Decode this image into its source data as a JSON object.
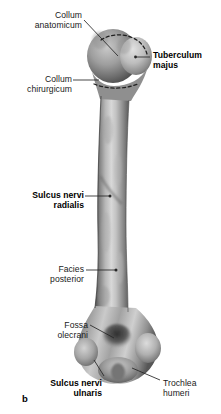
{
  "figure": {
    "letter": "b",
    "background_color": "#ffffff",
    "text_color": "#1a1a1a",
    "leader_line_color": "#262626"
  },
  "labels": [
    {
      "id": "collum-anatomicum",
      "line1": "Collum",
      "line2": "anatomicum",
      "bold": false,
      "align": "right",
      "x": 22,
      "y": 10
    },
    {
      "id": "tuberculum-majus",
      "line1": "Tuberculum",
      "line2": "majus",
      "bold": true,
      "align": "left",
      "x": 152,
      "y": 50
    },
    {
      "id": "collum-chirurgicum",
      "line1": "Collum",
      "line2": "chirurgicum",
      "bold": false,
      "align": "right",
      "x": 17,
      "y": 74
    },
    {
      "id": "sulcus-nervi-radialis",
      "line1": "Sulcus nervi",
      "line2": "radialis",
      "bold": true,
      "align": "right",
      "x": 16,
      "y": 190
    },
    {
      "id": "facies-posterior",
      "line1": "Facies",
      "line2": "posterior",
      "bold": false,
      "align": "right",
      "x": 36,
      "y": 264
    },
    {
      "id": "fossa-olecrani",
      "line1": "Fossa",
      "line2": "olecrani",
      "bold": false,
      "align": "right",
      "x": 44,
      "y": 320
    },
    {
      "id": "sulcus-nervi-ulnaris",
      "line1": "Sulcus nervi",
      "line2": "ulnaris",
      "bold": true,
      "align": "right",
      "x": 16,
      "y": 378
    },
    {
      "id": "trochlea-humeri",
      "line1": "Trochlea",
      "line2": "humeri",
      "bold": false,
      "align": "left",
      "x": 162,
      "y": 378
    }
  ]
}
